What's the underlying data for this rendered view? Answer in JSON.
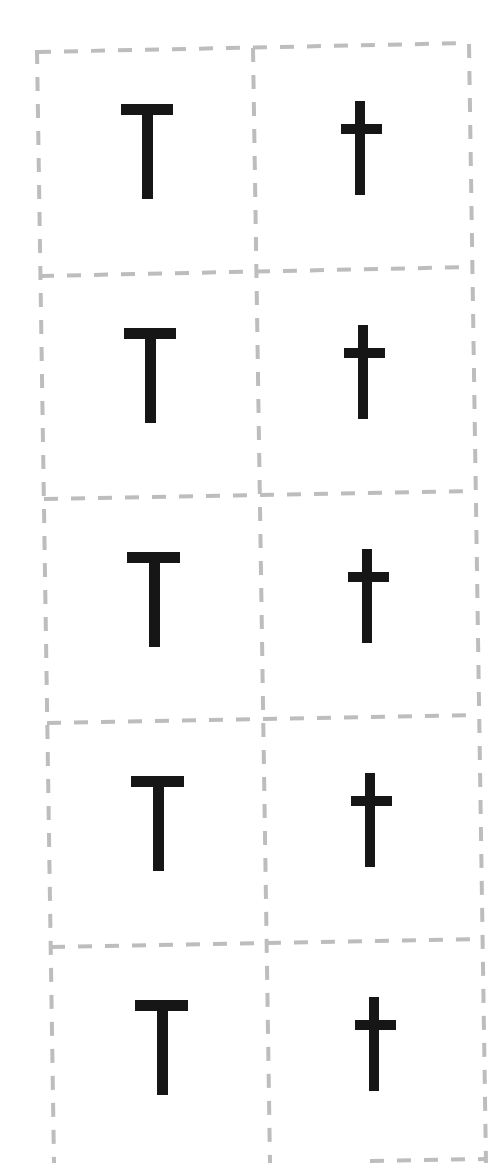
{
  "sheet": {
    "type": "letter flashcards",
    "letters": {
      "upper": "T",
      "lower": "t"
    },
    "rows": [
      {
        "left": "T",
        "right": "t"
      },
      {
        "left": "T",
        "right": "t"
      },
      {
        "left": "T",
        "right": "t"
      },
      {
        "left": "T",
        "right": "t"
      },
      {
        "left": "T",
        "right": "t"
      }
    ],
    "colors": {
      "cut_line": "#bdbdbd",
      "glyph": "#161616",
      "background": "#ffffff"
    }
  }
}
